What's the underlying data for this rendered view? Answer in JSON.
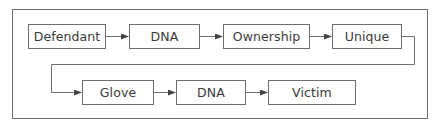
{
  "diagram": {
    "type": "flowchart",
    "rows": [
      {
        "nodes": [
          {
            "id": "defendant",
            "label": "Defendant"
          },
          {
            "id": "dna1",
            "label": "DNA"
          },
          {
            "id": "ownership",
            "label": "Ownership"
          },
          {
            "id": "unique",
            "label": "Unique"
          }
        ]
      },
      {
        "nodes": [
          {
            "id": "glove",
            "label": "Glove"
          },
          {
            "id": "dna2",
            "label": "DNA"
          },
          {
            "id": "victim",
            "label": "Victim"
          }
        ]
      }
    ],
    "edges": [
      {
        "from": "defendant",
        "to": "dna1"
      },
      {
        "from": "dna1",
        "to": "ownership"
      },
      {
        "from": "ownership",
        "to": "unique"
      },
      {
        "from": "unique",
        "to": "glove"
      },
      {
        "from": "glove",
        "to": "dna2"
      },
      {
        "from": "dna2",
        "to": "victim"
      }
    ],
    "colors": {
      "line": "#6e6e6e",
      "text": "#3a3a3a",
      "background": "#ffffff"
    }
  }
}
